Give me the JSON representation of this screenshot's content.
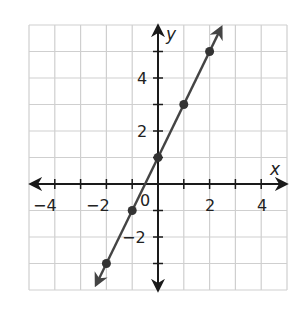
{
  "chart_data": {
    "type": "line",
    "title": "",
    "xlabel": "x",
    "ylabel": "y",
    "xlim": [
      -5,
      5
    ],
    "ylim": [
      -4,
      6
    ],
    "grid": true,
    "x_tick_labels": [
      "-4",
      "-2",
      "0",
      "2",
      "4"
    ],
    "y_tick_labels": [
      "4",
      "2",
      "-2"
    ],
    "origin_label": "0",
    "series": [
      {
        "name": "y = 2x + 1",
        "equation": "y = 2x + 1",
        "points": [
          {
            "x": -2,
            "y": -3
          },
          {
            "x": -1,
            "y": -1
          },
          {
            "x": 0,
            "y": 1
          },
          {
            "x": 1,
            "y": 3
          },
          {
            "x": 2,
            "y": 5
          }
        ],
        "arrows_both_ends": true,
        "color": "#444444"
      }
    ]
  },
  "labels": {
    "x_axis": "x",
    "y_axis": "y",
    "origin": "0",
    "xt_m4": "−4",
    "xt_m2": "−2",
    "xt_2": "2",
    "xt_4": "4",
    "yt_4": "4",
    "yt_2": "2",
    "yt_m2": "−2"
  },
  "colors": {
    "grid": "#cfcfcf",
    "axis": "#1a1a1a",
    "line": "#444444",
    "point": "#333333"
  }
}
